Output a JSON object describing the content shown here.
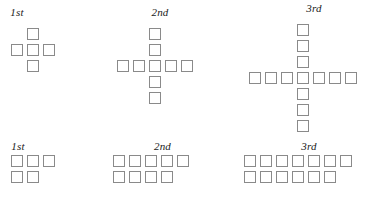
{
  "figure": {
    "square_size_px": 12,
    "square_pitch_px": 16,
    "border_color": "#8a8a8a",
    "fill_color": "#ffffff",
    "background_color": "#ffffff",
    "label_color": "#1a1a1a"
  },
  "chart_data": {
    "type": "table",
    "title": "",
    "xlabel": "",
    "ylabel": "",
    "categories": [
      "1st",
      "2nd",
      "3rd"
    ],
    "series": [
      {
        "name": "cross-form total squares",
        "values": [
          5,
          9,
          13
        ]
      },
      {
        "name": "two-row-form total squares",
        "values": [
          5,
          9,
          13
        ]
      }
    ]
  },
  "rows": [
    {
      "id": "top",
      "name": "cross-figures",
      "figures": [
        {
          "id": "top-1",
          "label": "1st",
          "shape": "cross",
          "arm_length": 1,
          "total_squares": 5,
          "cells": [
            [
              1,
              0
            ],
            [
              0,
              1
            ],
            [
              1,
              1
            ],
            [
              2,
              1
            ],
            [
              1,
              2
            ]
          ]
        },
        {
          "id": "top-2",
          "label": "2nd",
          "shape": "cross",
          "arm_length": 2,
          "total_squares": 9,
          "cells": [
            [
              2,
              0
            ],
            [
              2,
              1
            ],
            [
              0,
              2
            ],
            [
              1,
              2
            ],
            [
              2,
              2
            ],
            [
              3,
              2
            ],
            [
              4,
              2
            ],
            [
              2,
              3
            ],
            [
              2,
              4
            ]
          ]
        },
        {
          "id": "top-3",
          "label": "3rd",
          "shape": "cross",
          "arm_length": 3,
          "total_squares": 13,
          "cells": [
            [
              3,
              0
            ],
            [
              3,
              1
            ],
            [
              3,
              2
            ],
            [
              0,
              3
            ],
            [
              1,
              3
            ],
            [
              2,
              3
            ],
            [
              3,
              3
            ],
            [
              4,
              3
            ],
            [
              5,
              3
            ],
            [
              6,
              3
            ],
            [
              3,
              4
            ],
            [
              3,
              5
            ],
            [
              3,
              6
            ]
          ]
        }
      ]
    },
    {
      "id": "bottom",
      "name": "two-row-figures",
      "figures": [
        {
          "id": "bottom-1",
          "label": "1st",
          "shape": "two-rows",
          "top_count": 3,
          "bottom_count": 2,
          "total_squares": 5,
          "cells": [
            [
              0,
              0
            ],
            [
              1,
              0
            ],
            [
              2,
              0
            ],
            [
              0,
              1
            ],
            [
              1,
              1
            ]
          ]
        },
        {
          "id": "bottom-2",
          "label": "2nd",
          "shape": "two-rows",
          "top_count": 5,
          "bottom_count": 4,
          "total_squares": 9,
          "cells": [
            [
              0,
              0
            ],
            [
              1,
              0
            ],
            [
              2,
              0
            ],
            [
              3,
              0
            ],
            [
              4,
              0
            ],
            [
              0,
              1
            ],
            [
              1,
              1
            ],
            [
              2,
              1
            ],
            [
              3,
              1
            ]
          ]
        },
        {
          "id": "bottom-3",
          "label": "3rd",
          "shape": "two-rows",
          "top_count": 7,
          "bottom_count": 6,
          "total_squares": 13,
          "cells": [
            [
              0,
              0
            ],
            [
              1,
              0
            ],
            [
              2,
              0
            ],
            [
              3,
              0
            ],
            [
              4,
              0
            ],
            [
              5,
              0
            ],
            [
              6,
              0
            ],
            [
              0,
              1
            ],
            [
              1,
              1
            ],
            [
              2,
              1
            ],
            [
              3,
              1
            ],
            [
              4,
              1
            ],
            [
              5,
              1
            ]
          ]
        }
      ]
    }
  ]
}
